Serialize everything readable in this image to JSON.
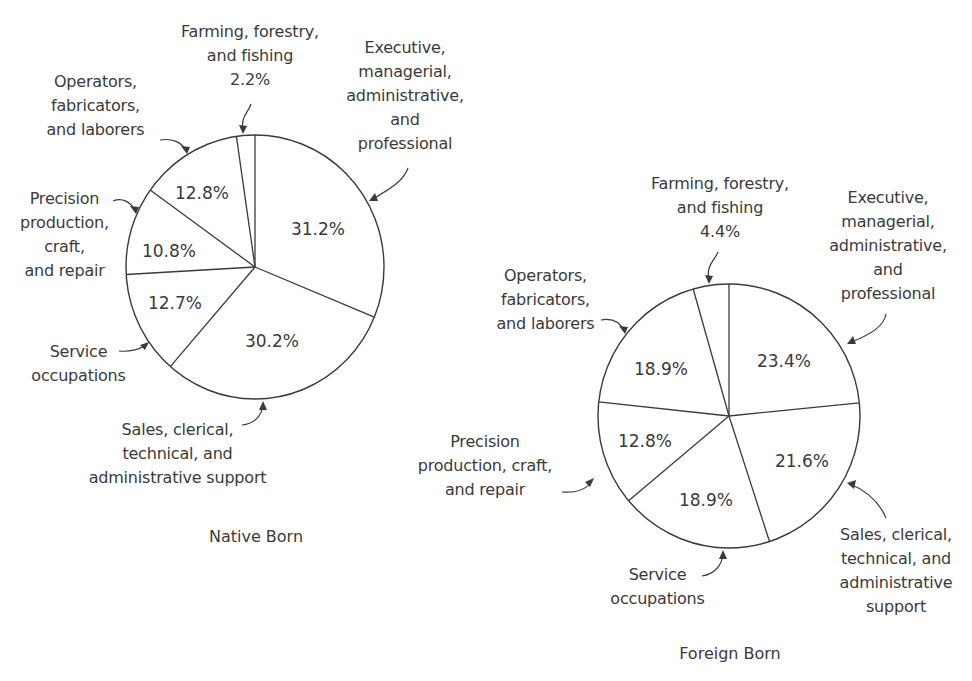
{
  "chart_data": [
    {
      "type": "pie",
      "title": "Native Born",
      "start_angle_deg": 0,
      "direction": "clockwise",
      "categories": [
        "Executive, managerial, administrative, and professional",
        "Sales, clerical, technical, and administrative support",
        "Service occupations",
        "Precision production, craft, and repair",
        "Operators, fabricators, and laborers",
        "Farming, forestry, and fishing"
      ],
      "values": [
        31.2,
        30.2,
        12.7,
        10.8,
        12.8,
        2.2
      ],
      "value_labels": [
        "31.2%",
        "30.2%",
        "12.7%",
        "10.8%",
        "12.8%",
        "2.2%"
      ],
      "unit": "%"
    },
    {
      "type": "pie",
      "title": "Foreign Born",
      "start_angle_deg": 0,
      "direction": "clockwise",
      "categories": [
        "Executive, managerial, administrative, and professional",
        "Sales, clerical, technical, and administrative support",
        "Service occupations",
        "Precision production, craft, and repair",
        "Operators, fabricators, and laborers",
        "Farming, forestry, and fishing"
      ],
      "values": [
        23.4,
        21.6,
        18.9,
        12.8,
        18.9,
        4.4
      ],
      "value_labels": [
        "23.4%",
        "21.6%",
        "18.9%",
        "12.8%",
        "18.9%",
        "4.4%"
      ],
      "unit": "%"
    }
  ],
  "native": {
    "title": "Native Born",
    "labels": {
      "executive": "Executive,\nmanagerial,\nadministrative,\nand\nprofessional",
      "sales": "Sales, clerical,\ntechnical, and\nadministrative support",
      "service": "Service\noccupations",
      "precision": "Precision\nproduction,\ncraft,\nand repair",
      "operators": "Operators,\nfabricators,\nand laborers",
      "farming": "Farming, forestry,\nand fishing\n2.2%"
    },
    "pcts": {
      "executive": "31.2%",
      "sales": "30.2%",
      "service": "12.7%",
      "precision": "10.8%",
      "operators": "12.8%"
    }
  },
  "foreign": {
    "title": "Foreign Born",
    "labels": {
      "executive": "Executive,\nmanagerial,\nadministrative,\nand\nprofessional",
      "sales": "Sales, clerical,\ntechnical, and\nadministrative\nsupport",
      "service": "Service\noccupations",
      "precision": "Precision\nproduction, craft,\nand repair",
      "operators": "Operators,\nfabricators,\nand laborers",
      "farming": "Farming, forestry,\nand fishing\n4.4%"
    },
    "pcts": {
      "executive": "23.4%",
      "sales": "21.6%",
      "service": "18.9%",
      "precision": "12.8%",
      "operators": "18.9%"
    }
  },
  "colors": {
    "stroke": "#3a3a3a",
    "fill": "#ffffff",
    "text": "#3a3a3a"
  }
}
